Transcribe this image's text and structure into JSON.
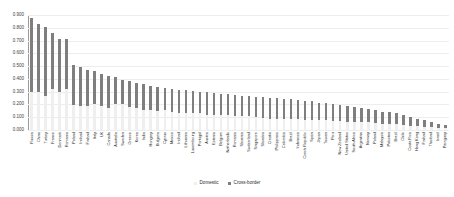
{
  "chart_data": {
    "type": "bar",
    "stacked": true,
    "title": "",
    "xlabel": "",
    "ylabel": "",
    "ylim": [
      0.0,
      0.9
    ],
    "ytick_labels": [
      "0.900",
      "0.800",
      "0.700",
      "0.600",
      "0.500",
      "0.400",
      "0.300",
      "0.200",
      "0.100",
      "0.000"
    ],
    "ytick_values": [
      0.9,
      0.8,
      0.7,
      0.6,
      0.5,
      0.4,
      0.3,
      0.2,
      0.1,
      0.0
    ],
    "grid": true,
    "legend_position": "bottom",
    "categories": [
      "Russia",
      "China",
      "Turkey",
      "France",
      "Denmark",
      "Romania",
      "Poland",
      "Ireland",
      "Finland",
      "Italy",
      "UK",
      "Canada",
      "Australia",
      "Sweden",
      "Greece",
      "Korea",
      "India",
      "Hungary",
      "Bulgaria",
      "Cyprus",
      "Mexico",
      "Ireland",
      "Lithuania",
      "Luxembourg",
      "Portugal",
      "Austria",
      "Estonia",
      "Belgium",
      "Netherlands",
      "Romania",
      "Slovenia",
      "Switzerland",
      "Singapore",
      "Slovakia",
      "Croatia",
      "Philippines",
      "Colombia",
      "Brazil",
      "Indonesia",
      "Czech Republic",
      "Spain",
      "Japan",
      "Taiwan",
      "Peru",
      "New Zealand",
      "United States",
      "South Africa",
      "Argentina",
      "Norway",
      "Poland",
      "Malaysia",
      "Pakistan",
      "Brazil",
      "Chile",
      "Costa Rica",
      "Hong Kong",
      "Finland",
      "Thailand",
      "Israel",
      "Paraguay"
    ],
    "series": [
      {
        "name": "Cross-border",
        "color": "#7f7f7f",
        "values": [
          0.585,
          0.53,
          0.545,
          0.44,
          0.41,
          0.39,
          0.315,
          0.3,
          0.285,
          0.255,
          0.25,
          0.245,
          0.21,
          0.195,
          0.2,
          0.195,
          0.2,
          0.19,
          0.185,
          0.175,
          0.18,
          0.18,
          0.175,
          0.175,
          0.17,
          0.175,
          0.17,
          0.165,
          0.165,
          0.165,
          0.16,
          0.155,
          0.155,
          0.16,
          0.16,
          0.16,
          0.155,
          0.155,
          0.15,
          0.15,
          0.145,
          0.14,
          0.135,
          0.13,
          0.125,
          0.12,
          0.115,
          0.11,
          0.105,
          0.1,
          0.095,
          0.09,
          0.085,
          0.08,
          0.07,
          0.06,
          0.05,
          0.04,
          0.032,
          0.026
        ]
      },
      {
        "name": "Domestic",
        "color": "#efefef",
        "values": [
          0.295,
          0.3,
          0.265,
          0.32,
          0.3,
          0.32,
          0.195,
          0.19,
          0.185,
          0.205,
          0.19,
          0.175,
          0.205,
          0.2,
          0.18,
          0.175,
          0.16,
          0.155,
          0.15,
          0.155,
          0.14,
          0.135,
          0.135,
          0.13,
          0.13,
          0.12,
          0.12,
          0.12,
          0.115,
          0.11,
          0.11,
          0.11,
          0.105,
          0.095,
          0.09,
          0.09,
          0.085,
          0.085,
          0.085,
          0.08,
          0.08,
          0.075,
          0.075,
          0.07,
          0.07,
          0.065,
          0.065,
          0.06,
          0.06,
          0.055,
          0.05,
          0.048,
          0.045,
          0.04,
          0.035,
          0.03,
          0.026,
          0.022,
          0.016,
          0.012
        ]
      }
    ]
  },
  "legend": {
    "items": [
      {
        "label": "Domestic",
        "color": "#efefef"
      },
      {
        "label": "Cross-border",
        "color": "#7f7f7f"
      }
    ]
  }
}
